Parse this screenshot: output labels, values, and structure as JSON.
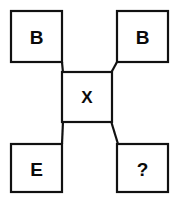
{
  "diagram": {
    "type": "node-link",
    "background_color": "#ffffff",
    "stroke_color": "#111111",
    "text_color": "#0a0a0a",
    "node_fill": "#ffffff",
    "nodes": [
      {
        "id": "top-left",
        "label": "B",
        "x": 11,
        "y": 11,
        "w": 51,
        "h": 51
      },
      {
        "id": "top-right",
        "label": "B",
        "x": 117,
        "y": 11,
        "w": 51,
        "h": 51
      },
      {
        "id": "center",
        "label": "X",
        "x": 62,
        "y": 72,
        "w": 50,
        "h": 50
      },
      {
        "id": "bottom-left",
        "label": "E",
        "x": 11,
        "y": 144,
        "w": 51,
        "h": 48
      },
      {
        "id": "bottom-right",
        "label": "?",
        "x": 117,
        "y": 144,
        "w": 51,
        "h": 48
      }
    ],
    "edges": [
      {
        "id": "edge-top-left-to-center",
        "from": "top-left",
        "to": "center",
        "x1": 62,
        "y1": 62,
        "x2": 63,
        "y2": 73
      },
      {
        "id": "edge-top-right-to-center",
        "from": "top-right",
        "to": "center",
        "x1": 117,
        "y1": 62,
        "x2": 111,
        "y2": 73
      },
      {
        "id": "edge-center-to-bottom-left",
        "from": "center",
        "to": "bottom-left",
        "x1": 63,
        "y1": 121,
        "x2": 62,
        "y2": 144
      },
      {
        "id": "edge-center-to-bottom-right",
        "from": "center",
        "to": "bottom-right",
        "x1": 111,
        "y1": 121,
        "x2": 118,
        "y2": 144
      }
    ]
  }
}
